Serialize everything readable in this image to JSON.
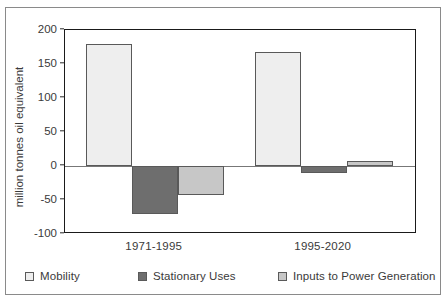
{
  "chart_data": {
    "type": "bar",
    "title": "",
    "xlabel": "",
    "ylabel": "million tonnes oil equivalent",
    "categories": [
      "1971-1995",
      "1995-2020"
    ],
    "ylim": [
      -100,
      200
    ],
    "yticks": [
      200,
      150,
      100,
      50,
      0,
      -50,
      -100
    ],
    "ytick_labels": [
      "200",
      "150",
      "100",
      "50",
      "0",
      "-50",
      "-100"
    ],
    "grid": false,
    "legend_position": "bottom",
    "series": [
      {
        "name": "Mobility",
        "color": "#eeeeee",
        "values": [
          180,
          167
        ]
      },
      {
        "name": "Stationary Uses",
        "color": "#6e6e6e",
        "values": [
          -70,
          -11
        ]
      },
      {
        "name": "Inputs to Power Generation",
        "color": "#c7c7c7",
        "values": [
          -42,
          8
        ]
      }
    ]
  },
  "axis": {
    "ylabel": "million tonnes oil equivalent",
    "tick_200": "200",
    "tick_150": "150",
    "tick_100": "100",
    "tick_50": "50",
    "tick_0": "0",
    "tick_m50": "-50",
    "tick_m100": "-100",
    "cat_1": "1971-1995",
    "cat_2": "1995-2020"
  },
  "legend": {
    "items": [
      {
        "label": "Mobility",
        "color": "#eeeeee"
      },
      {
        "label": "Stationary Uses",
        "color": "#6e6e6e"
      },
      {
        "label": "Inputs to Power Generation",
        "color": "#c7c7c7"
      }
    ]
  },
  "colors": {
    "mobility": "#eeeeee",
    "stationary": "#6e6e6e",
    "power": "#c7c7c7",
    "frame": "#1a1a1a",
    "outer_frame": "#8a8a8a",
    "text": "#3a3a3a"
  }
}
